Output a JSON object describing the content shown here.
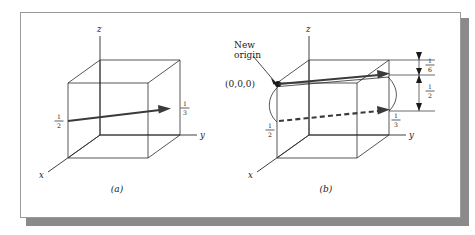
{
  "figure": {
    "panels": [
      {
        "id": "a",
        "caption": "(a)",
        "axes": {
          "x": "x",
          "y": "y",
          "z": "z"
        },
        "labels": {
          "left_fraction_num": "1",
          "left_fraction_den": "2",
          "right_fraction_num": "1",
          "right_fraction_den": "3"
        }
      },
      {
        "id": "b",
        "caption": "(b)",
        "axes": {
          "x": "x",
          "y": "y",
          "z": "z"
        },
        "labels": {
          "new_origin_line1": "New",
          "new_origin_line2": "origin",
          "origin_coords": "(0,0,0)",
          "left_fraction_num": "1",
          "left_fraction_den": "2",
          "right_fraction_num": "1",
          "right_fraction_den": "3",
          "dim_top_num": "1",
          "dim_top_den": "6",
          "dim_mid_num": "1",
          "dim_mid_den": "2"
        }
      }
    ],
    "colors": {
      "line": "#2b2b2b",
      "vector": "#3a3a3a",
      "frame_border": "#9a9a9a",
      "shadow": "#8a8a8a",
      "background": "#ffffff"
    }
  }
}
